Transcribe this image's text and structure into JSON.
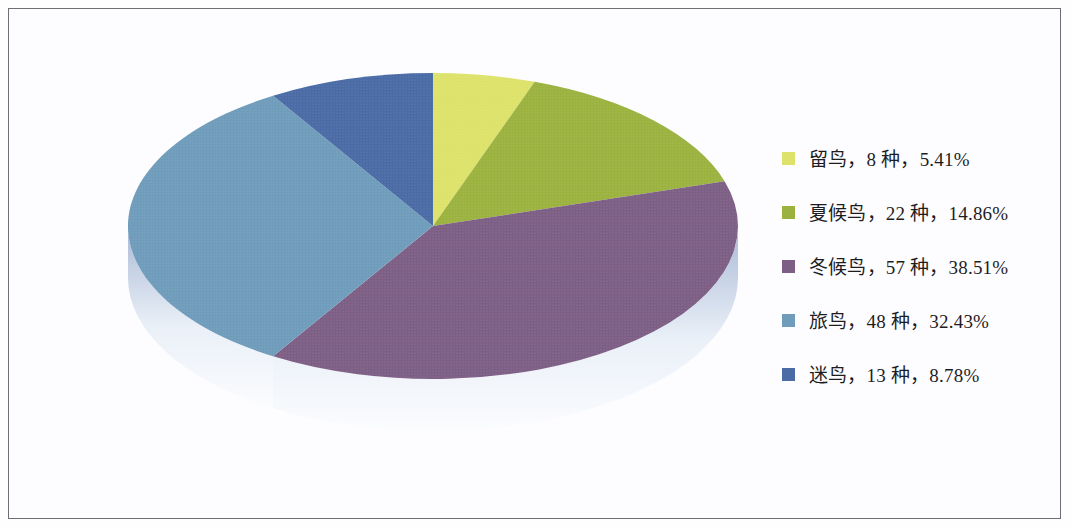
{
  "figure": {
    "border_color": "#6d6f72",
    "background": "#fdfdff"
  },
  "legend": {
    "position": "right",
    "items": [
      {
        "label": "留鸟，8 种，5.41%",
        "color": "#dde26a"
      },
      {
        "label": "夏候鸟，22 种，14.86%",
        "color": "#9bb23f"
      },
      {
        "label": "冬候鸟，57 种，38.51%",
        "color": "#7d5e85"
      },
      {
        "label": "旅鸟，48 种，32.43%",
        "color": "#6f9cbb"
      },
      {
        "label": "迷鸟，13 种，8.78%",
        "color": "#4a6ba5"
      }
    ]
  },
  "chart_data": {
    "type": "pie",
    "title": "",
    "three_d": true,
    "start_angle_deg": 0,
    "direction": "clockwise",
    "depth_color_top": "#b9c7dd",
    "depth_color_bottom": "#f4f7fc",
    "categories": [
      "留鸟",
      "夏候鸟",
      "冬候鸟",
      "旅鸟",
      "迷鸟"
    ],
    "unit": "种",
    "values": [
      8,
      22,
      57,
      48,
      13
    ],
    "percents": [
      5.41,
      14.86,
      38.51,
      32.43,
      8.78
    ],
    "total": 148,
    "colors": [
      "#dde26a",
      "#9bb23f",
      "#7d5e85",
      "#6f9cbb",
      "#4a6ba5"
    ],
    "labels": [
      "留鸟，8 种，5.41%",
      "夏候鸟，22 种，14.86%",
      "冬候鸟，57 种，38.51%",
      "旅鸟，48 种，32.43%",
      "迷鸟，13 种，8.78%"
    ],
    "legend_position": "right",
    "grid": false,
    "xlabel": "",
    "ylabel": ""
  }
}
